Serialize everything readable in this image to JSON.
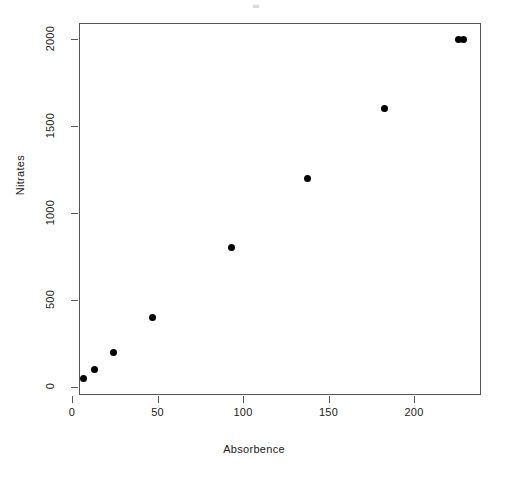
{
  "chart_data": {
    "type": "scatter",
    "title": "",
    "xlabel": "Absorbence",
    "ylabel": "Nitrates",
    "xlim": [
      0,
      235
    ],
    "ylim": [
      0,
      2060
    ],
    "grid": false,
    "legend": null,
    "xticks": [
      0,
      50,
      100,
      150,
      200
    ],
    "yticks": [
      0,
      500,
      1000,
      1500,
      2000
    ],
    "xticklabels": [
      "0",
      "50",
      "100",
      "150",
      "200"
    ],
    "yticklabels": [
      "0",
      "500",
      "1000",
      "1500",
      "2000"
    ],
    "marker": "filled-circle",
    "marker_color": "#000000",
    "points": [
      {
        "x": 7,
        "y": 50
      },
      {
        "x": 13,
        "y": 100
      },
      {
        "x": 24,
        "y": 200
      },
      {
        "x": 47,
        "y": 400
      },
      {
        "x": 93,
        "y": 800
      },
      {
        "x": 138,
        "y": 1200
      },
      {
        "x": 183,
        "y": 1600
      },
      {
        "x": 226,
        "y": 2000
      },
      {
        "x": 229,
        "y": 2000
      }
    ]
  },
  "figure": {
    "background_color": "#ffffff",
    "axis_color": "#555555",
    "text_color": "#1a1a1a"
  }
}
